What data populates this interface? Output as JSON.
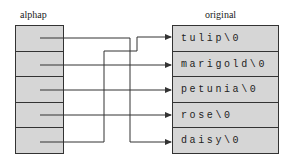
{
  "diagram": {
    "left_array": {
      "label": "alphap",
      "cells": 5
    },
    "right_array": {
      "label": "original",
      "strings": [
        "tulip\\0",
        "marigold\\0",
        "petunia\\0",
        "rose\\0",
        "daisy\\0"
      ]
    },
    "pointers": [
      {
        "from": 0,
        "to": 4
      },
      {
        "from": 1,
        "to": 1
      },
      {
        "from": 2,
        "to": 2
      },
      {
        "from": 3,
        "to": 3
      },
      {
        "from": 4,
        "to": 0
      }
    ],
    "colors": {
      "fill": "#d6d6d6",
      "line": "#333333"
    }
  }
}
